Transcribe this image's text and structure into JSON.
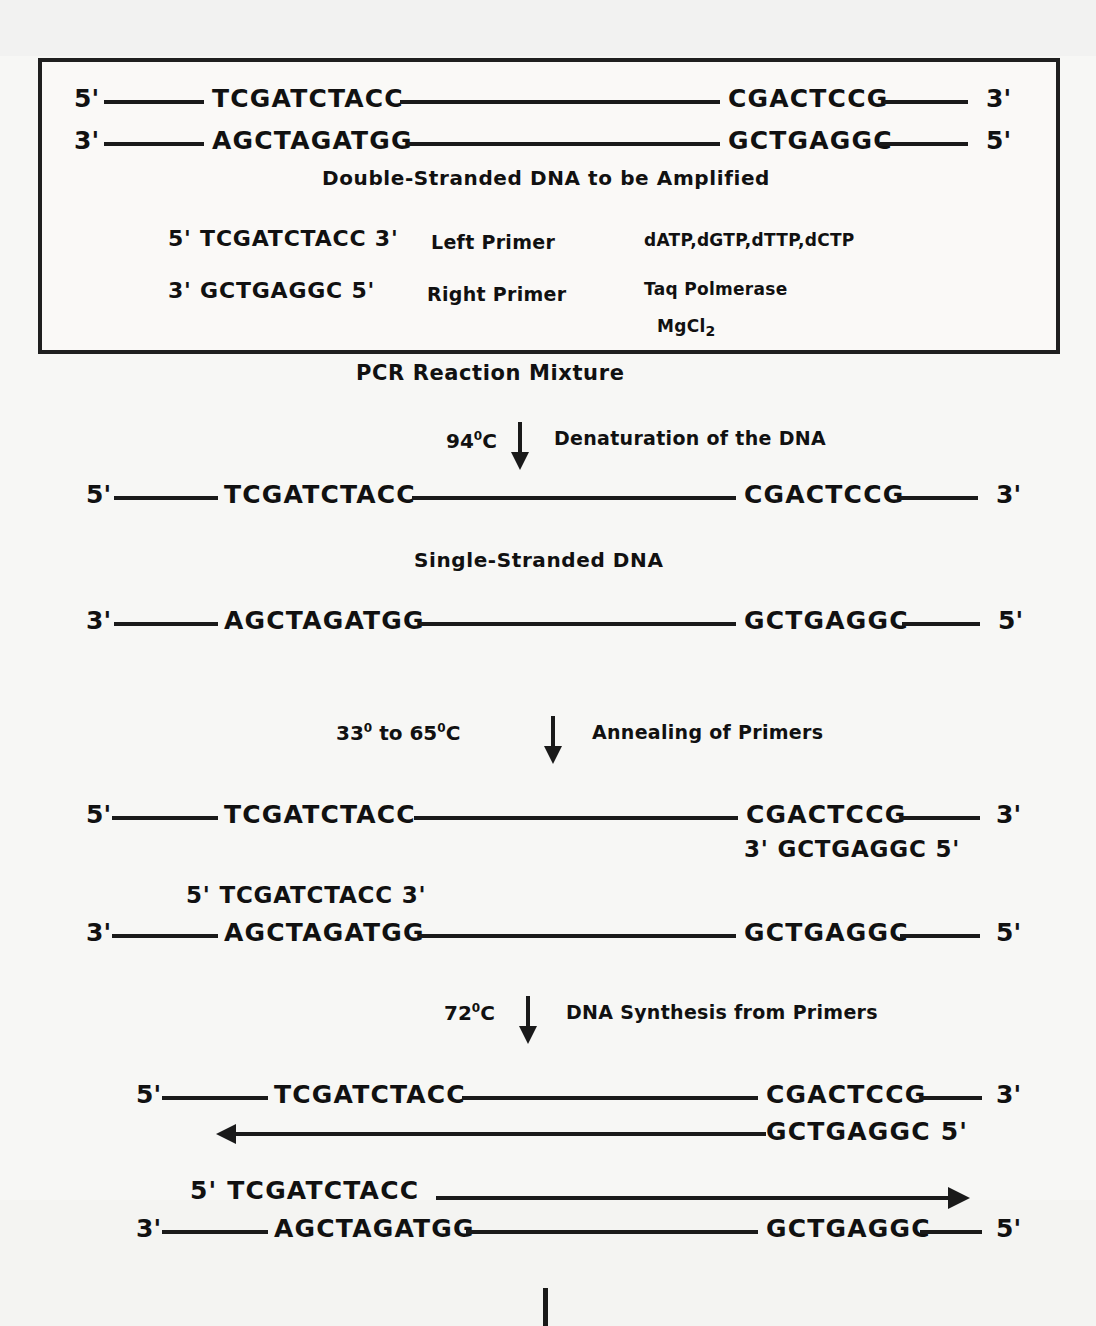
{
  "diagram": {
    "title": "PCR Reaction Mixture",
    "reaction_box": {
      "template_top": {
        "five_prime": "5'",
        "left_sequence": "TCGATCTACC",
        "right_sequence": "CGACTCCG",
        "three_prime": "3'"
      },
      "template_bottom": {
        "three_prime": "3'",
        "left_sequence": "AGCTAGATGG",
        "right_sequence": "GCTGAGGC",
        "five_prime": "5'"
      },
      "template_caption": "Double-Stranded DNA to be Amplified",
      "left_primer": {
        "sequence": "5' TCGATCTACC 3'",
        "name": "Left Primer"
      },
      "right_primer": {
        "sequence": "3' GCTGAGGC 5'",
        "name": "Right Primer"
      },
      "reagents": [
        "dATP,dGTP,dTTP,dCTP",
        "Taq Polmerase",
        "MgCl2"
      ],
      "reagent_mgcl2_base": "MgCl",
      "reagent_mgcl2_sub": "2"
    },
    "steps": [
      {
        "temperature_value": "94",
        "temperature_degree": "0",
        "temperature_unit": "C",
        "label": "Denaturation of the DNA"
      },
      {
        "temperature_value": "33",
        "temperature_degree": "0",
        "temperature_to": "to",
        "temperature_value2": "65",
        "temperature_degree2": "0",
        "temperature_unit": "C",
        "label": "Annealing of Primers"
      },
      {
        "temperature_value": "72",
        "temperature_degree": "0",
        "temperature_unit": "C",
        "label": "DNA Synthesis from Primers"
      }
    ],
    "denatured": {
      "caption": "Single-Stranded DNA",
      "top_strand": {
        "five_prime": "5'",
        "left_sequence": "TCGATCTACC",
        "right_sequence": "CGACTCCG",
        "three_prime": "3'"
      },
      "bottom_strand": {
        "three_prime": "3'",
        "left_sequence": "AGCTAGATGG",
        "right_sequence": "GCTGAGGC",
        "five_prime": "5'"
      }
    },
    "annealed": {
      "top_strand": {
        "five_prime": "5'",
        "left_sequence": "TCGATCTACC",
        "right_sequence": "CGACTCCG",
        "three_prime": "3'"
      },
      "right_primer_bound": "3' GCTGAGGC 5'",
      "left_primer_bound": "5' TCGATCTACC 3'",
      "bottom_strand": {
        "three_prime": "3'",
        "left_sequence": "AGCTAGATGG",
        "right_sequence": "GCTGAGGC",
        "five_prime": "5'"
      }
    },
    "synthesis": {
      "top_strand": {
        "five_prime": "5'",
        "left_sequence": "TCGATCTACC",
        "right_sequence": "CGACTCCG",
        "three_prime": "3'"
      },
      "new_strand_top": "GCTGAGGC 5'",
      "new_strand_bottom": "5' TCGATCTACC",
      "bottom_strand": {
        "three_prime": "3'",
        "left_sequence": "AGCTAGATGG",
        "right_sequence": "GCTGAGGC",
        "five_prime": "5'"
      }
    }
  }
}
